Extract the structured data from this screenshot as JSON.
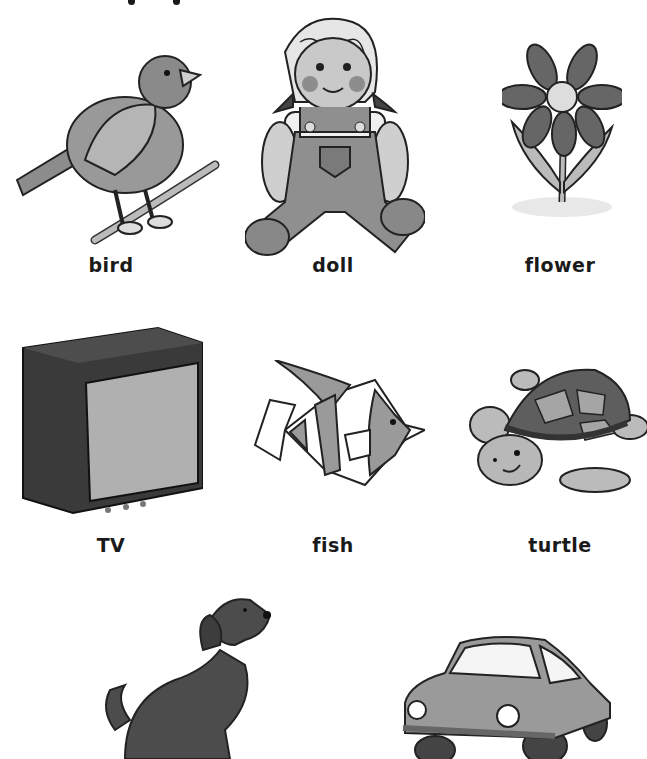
{
  "worksheet": {
    "items": [
      {
        "id": "bird",
        "label": "bird",
        "icon": "bird-icon"
      },
      {
        "id": "doll",
        "label": "doll",
        "icon": "doll-icon"
      },
      {
        "id": "flower",
        "label": "flower",
        "icon": "flower-icon"
      },
      {
        "id": "tv",
        "label": "TV",
        "icon": "tv-icon"
      },
      {
        "id": "fish",
        "label": "fish",
        "icon": "fish-icon"
      },
      {
        "id": "turtle",
        "label": "turtle",
        "icon": "turtle-icon"
      },
      {
        "id": "dog",
        "label": "",
        "icon": "dog-icon"
      },
      {
        "id": "car",
        "label": "",
        "icon": "car-icon"
      }
    ]
  },
  "colors": {
    "text": "#1a1a1a",
    "dark_gray": "#4a4a4a",
    "mid_gray": "#8a8a8a",
    "light_gray": "#c8c8c8",
    "background": "#ffffff"
  }
}
